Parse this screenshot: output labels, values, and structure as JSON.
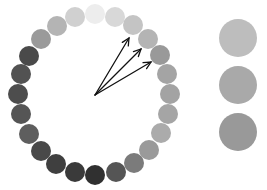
{
  "wheel": {
    "center": [
      95,
      95
    ],
    "circle_radius": 10,
    "circles": [
      {
        "x": 95,
        "y": 14,
        "color": "#ededed"
      },
      {
        "x": 115,
        "y": 17,
        "color": "#d8d8d8"
      },
      {
        "x": 133,
        "y": 25,
        "color": "#c4c4c4"
      },
      {
        "x": 148,
        "y": 39,
        "color": "#b4b4b4"
      },
      {
        "x": 160,
        "y": 55,
        "color": "#999999"
      },
      {
        "x": 167,
        "y": 74,
        "color": "#a4a4a4"
      },
      {
        "x": 170,
        "y": 94,
        "color": "#a3a3a3"
      },
      {
        "x": 168,
        "y": 114,
        "color": "#a5a5a5"
      },
      {
        "x": 161,
        "y": 133,
        "color": "#ababab"
      },
      {
        "x": 149,
        "y": 150,
        "color": "#9a9a9a"
      },
      {
        "x": 134,
        "y": 163,
        "color": "#7b7b7b"
      },
      {
        "x": 116,
        "y": 172,
        "color": "#555555"
      },
      {
        "x": 95,
        "y": 175,
        "color": "#303030"
      },
      {
        "x": 75,
        "y": 172,
        "color": "#3a3a3a"
      },
      {
        "x": 56,
        "y": 164,
        "color": "#3f3f3f"
      },
      {
        "x": 41,
        "y": 151,
        "color": "#494949"
      },
      {
        "x": 29,
        "y": 134,
        "color": "#5e5e5e"
      },
      {
        "x": 21,
        "y": 114,
        "color": "#555555"
      },
      {
        "x": 18,
        "y": 94,
        "color": "#4d4d4d"
      },
      {
        "x": 21,
        "y": 74,
        "color": "#525252"
      },
      {
        "x": 29,
        "y": 56,
        "color": "#4a4a4a"
      },
      {
        "x": 41,
        "y": 39,
        "color": "#9a9a9a"
      },
      {
        "x": 57,
        "y": 26,
        "color": "#b4b4b4"
      },
      {
        "x": 75,
        "y": 17,
        "color": "#d0d0d0"
      }
    ],
    "arrows": [
      {
        "x2": 129,
        "y2": 38
      },
      {
        "x2": 141,
        "y2": 49
      },
      {
        "x2": 151,
        "y2": 62
      }
    ],
    "arrow_color": "#111111"
  },
  "swatches": [
    {
      "x": 238,
      "y": 38,
      "r": 19,
      "color": "#bdbdbd"
    },
    {
      "x": 238,
      "y": 85,
      "r": 19,
      "color": "#a9a9a9"
    },
    {
      "x": 238,
      "y": 132,
      "r": 19,
      "color": "#999999"
    }
  ]
}
